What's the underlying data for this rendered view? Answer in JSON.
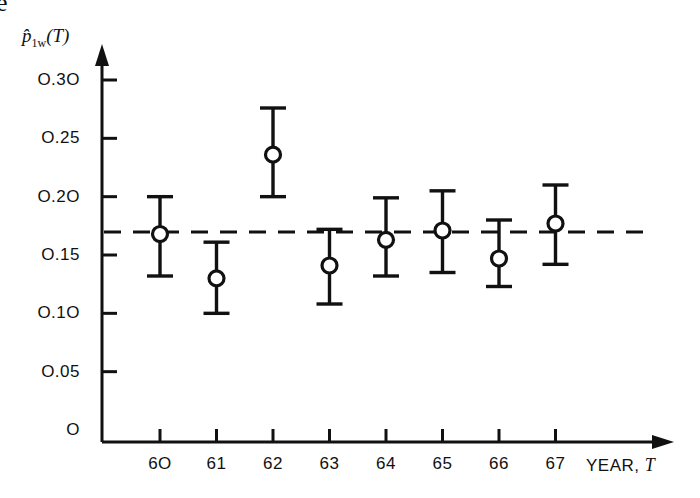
{
  "figure": {
    "corner_fragment": "e",
    "y_axis_label": "p̂",
    "y_axis_label_sub": "1w",
    "y_axis_label_arg": "(T)",
    "x_axis_title_text": "YEAR,",
    "x_axis_title_var": "T"
  },
  "chart_data": {
    "type": "scatter",
    "title": "",
    "xlabel": "YEAR, T",
    "ylabel": "p̂1w(T)",
    "categories": [
      "60",
      "61",
      "62",
      "63",
      "64",
      "65",
      "66",
      "67"
    ],
    "x": [
      60,
      61,
      62,
      63,
      64,
      65,
      66,
      67
    ],
    "values": [
      0.168,
      0.13,
      0.236,
      0.141,
      0.163,
      0.171,
      0.147,
      0.177
    ],
    "error_upper": [
      0.2,
      0.161,
      0.276,
      0.172,
      0.199,
      0.205,
      0.18,
      0.21
    ],
    "error_lower": [
      0.132,
      0.1,
      0.2,
      0.108,
      0.132,
      0.135,
      0.123,
      0.142
    ],
    "reference_line": 0.169,
    "reference_line_style": "dashed",
    "ylim": [
      0.0,
      0.32
    ],
    "yticks": [
      0.05,
      0.1,
      0.15,
      0.2,
      0.25,
      0.3
    ],
    "ytick_labels": [
      "O.05",
      "O.1O",
      "O.15",
      "O.2O",
      "O.25",
      "O.3O"
    ],
    "y_origin_label": "O",
    "xtick_labels": [
      "6O",
      "61",
      "62",
      "63",
      "64",
      "65",
      "66",
      "67"
    ],
    "grid": false,
    "legend": "none",
    "marker": "open-circle",
    "errorbar_caps": true,
    "axis_arrows": [
      "y-up",
      "x-right"
    ],
    "colors": {
      "ink": "#111111",
      "background": "#ffffff"
    }
  }
}
